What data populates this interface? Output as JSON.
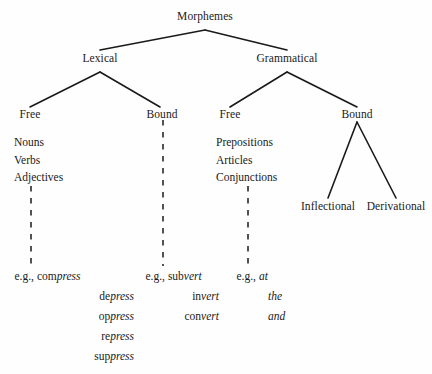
{
  "diagram": {
    "title": "Morphemes",
    "ink_color": "#1a1a1a",
    "background_color": "#fefefe",
    "nodes": {
      "root": "Morphemes",
      "lexical": "Lexical",
      "grammatical": "Grammatical",
      "lexical_free": "Free",
      "lexical_bound": "Bound",
      "grammatical_free": "Free",
      "grammatical_bound": "Bound",
      "inflectional": "Inflectional",
      "derivational": "Derivational"
    },
    "lexical_free_list": [
      "Nouns",
      "Verbs",
      "Adjectives"
    ],
    "grammatical_free_list": [
      "Prepositions",
      "Articles",
      "Conjunctions"
    ],
    "examples": {
      "lexical_free": {
        "label": "e.g.,",
        "items": [
          {
            "prefix": "com",
            "stem": "press"
          },
          {
            "prefix": "de",
            "stem": "press"
          },
          {
            "prefix": "op",
            "stem": "press"
          },
          {
            "prefix": "re",
            "stem": "press"
          },
          {
            "prefix": "sup",
            "stem": "press"
          }
        ]
      },
      "lexical_bound": {
        "label": "e.g.,",
        "items": [
          {
            "prefix": "sub",
            "stem": "vert"
          },
          {
            "prefix": "in",
            "stem": "vert"
          },
          {
            "prefix": "con",
            "stem": "vert"
          }
        ]
      },
      "grammatical_free": {
        "label": "e.g.,",
        "items": [
          {
            "prefix": "",
            "stem": "at"
          },
          {
            "prefix": "",
            "stem": "the"
          },
          {
            "prefix": "",
            "stem": "and"
          }
        ]
      }
    }
  }
}
